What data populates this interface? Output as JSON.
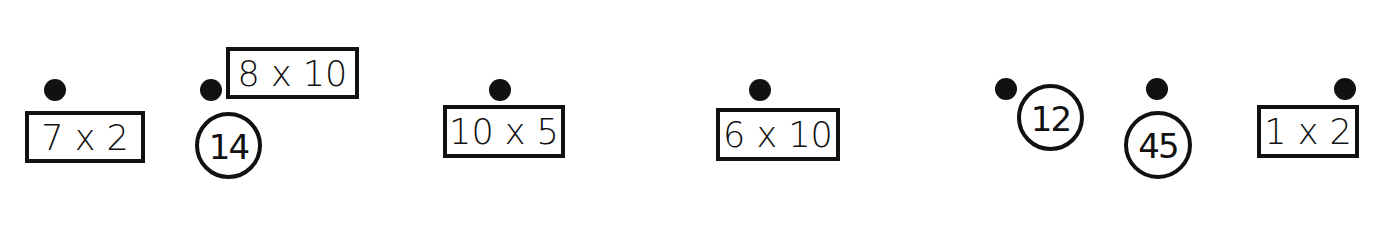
{
  "items": [
    {
      "kind": "box",
      "label": "7 x 2"
    },
    {
      "kind": "box",
      "label": "8 x 10"
    },
    {
      "kind": "circle",
      "label": "14"
    },
    {
      "kind": "box",
      "label": "10 x 5"
    },
    {
      "kind": "box",
      "label": "6 x 10"
    },
    {
      "kind": "circle",
      "label": "12"
    },
    {
      "kind": "circle",
      "label": "45"
    },
    {
      "kind": "box",
      "label": "1 x 2"
    }
  ],
  "dot_count": 7,
  "colors": {
    "ink": "#111111",
    "background": "#ffffff"
  }
}
